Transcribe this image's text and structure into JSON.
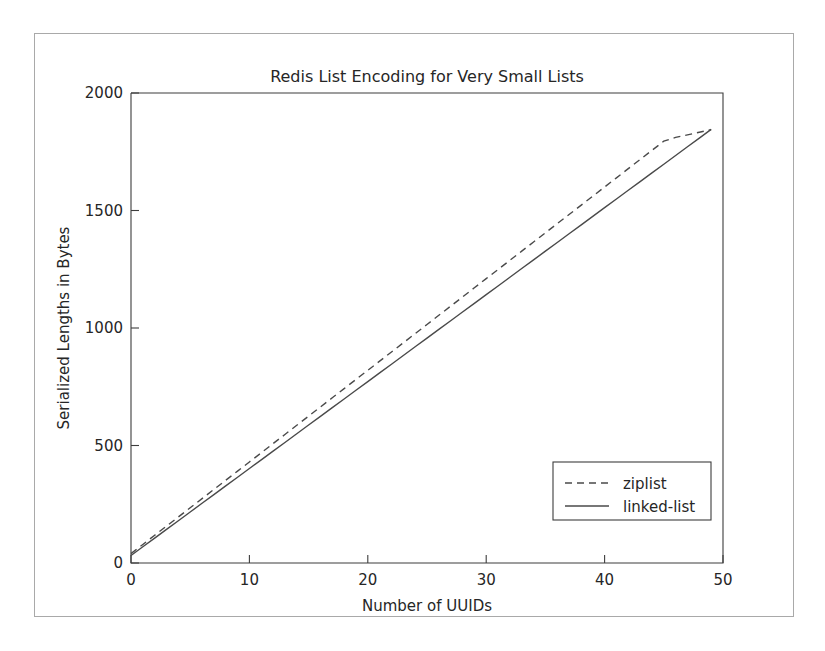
{
  "chart_data": {
    "type": "line",
    "title": "Redis List Encoding for Very Small Lists",
    "xlabel": "Number of UUIDs",
    "ylabel": "Serialized Lengths in Bytes",
    "xlim": [
      0,
      50
    ],
    "ylim": [
      0,
      2000
    ],
    "xticks": [
      "0",
      "10",
      "20",
      "30",
      "40",
      "50"
    ],
    "xtick_values": [
      0,
      10,
      20,
      30,
      40,
      50
    ],
    "yticks": [
      "0",
      "500",
      "1000",
      "1500",
      "2000"
    ],
    "ytick_values": [
      0,
      500,
      1000,
      1500,
      2000
    ],
    "grid": false,
    "legend_position": "lower right",
    "x": [
      0,
      1,
      2,
      3,
      4,
      5,
      6,
      7,
      8,
      9,
      10,
      11,
      12,
      13,
      14,
      15,
      16,
      17,
      18,
      19,
      20,
      21,
      22,
      23,
      24,
      25,
      26,
      27,
      28,
      29,
      30,
      31,
      32,
      33,
      34,
      35,
      36,
      37,
      38,
      39,
      40,
      41,
      42,
      43,
      44,
      45,
      46,
      47,
      48,
      49
    ],
    "series": [
      {
        "name": "ziplist",
        "style": "dashed",
        "color": "#4a4a4a",
        "values": [
          40,
          79,
          118,
          157,
          196,
          235,
          274,
          313,
          352,
          391,
          430,
          469,
          508,
          547,
          586,
          625,
          664,
          703,
          742,
          781,
          820,
          859,
          898,
          937,
          976,
          1015,
          1054,
          1093,
          1132,
          1171,
          1210,
          1249,
          1288,
          1327,
          1366,
          1405,
          1444,
          1483,
          1522,
          1561,
          1600,
          1639,
          1678,
          1717,
          1756,
          1795,
          1811,
          1822,
          1833,
          1844
        ]
      },
      {
        "name": "linked-list",
        "style": "solid",
        "color": "#4a4a4a",
        "values": [
          32,
          69,
          106,
          143,
          180,
          217,
          254,
          291,
          328,
          365,
          402,
          439,
          476,
          513,
          550,
          587,
          624,
          661,
          698,
          735,
          772,
          809,
          846,
          883,
          920,
          957,
          994,
          1031,
          1068,
          1105,
          1142,
          1179,
          1216,
          1253,
          1290,
          1327,
          1364,
          1401,
          1438,
          1475,
          1512,
          1549,
          1586,
          1623,
          1660,
          1697,
          1734,
          1771,
          1808,
          1845
        ]
      }
    ]
  }
}
